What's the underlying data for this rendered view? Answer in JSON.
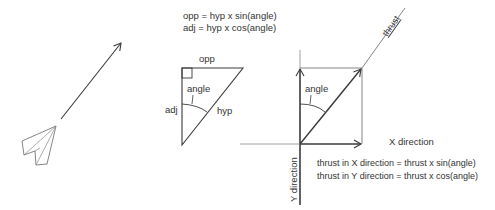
{
  "colors": {
    "line": "#3a3a3a",
    "light_line": "#666666",
    "plane": "#777777",
    "text": "#333333",
    "background": "#ffffff"
  },
  "formulas": {
    "opp": "opp = hyp x sin(angle)",
    "adj": "adj = hyp x cos(angle)"
  },
  "triangle": {
    "opp_label": "opp",
    "adj_label": "adj",
    "hyp_label": "hyp",
    "angle_label": "angle"
  },
  "thrust_diagram": {
    "thrust_label": "thrust",
    "angle_label": "angle",
    "x_direction_label": "X direction",
    "y_direction_label": "Y direction",
    "x_formula": "thrust in X direction = thrust x sin(angle)",
    "y_formula": "thrust in Y direction = thrust x cos(angle)"
  },
  "icons": {
    "paper_plane": "paper-plane-icon",
    "flight_arrow": "arrow-icon"
  }
}
